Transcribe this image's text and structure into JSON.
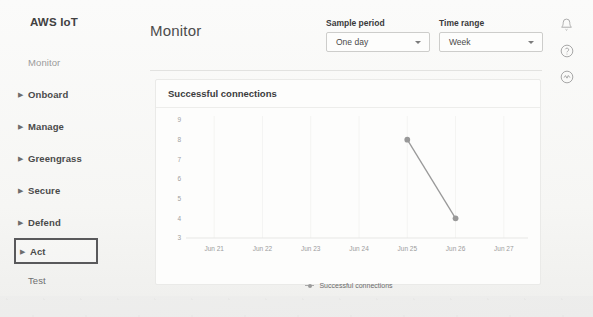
{
  "sidebar": {
    "brand": "AWS IoT",
    "items": [
      {
        "label": "Monitor",
        "style": "muted",
        "caret": false
      },
      {
        "label": "Onboard",
        "style": "bold",
        "caret": true
      },
      {
        "label": "Manage",
        "style": "bold",
        "caret": true
      },
      {
        "label": "Greengrass",
        "style": "bold",
        "caret": true
      },
      {
        "label": "Secure",
        "style": "bold",
        "caret": true
      },
      {
        "label": "Defend",
        "style": "bold",
        "caret": true
      },
      {
        "label": "Act",
        "style": "highlighted",
        "caret": true
      },
      {
        "label": "Test",
        "style": "plain",
        "caret": false
      }
    ],
    "caret_glyph": "▶"
  },
  "header": {
    "title": "Monitor",
    "controls": [
      {
        "label": "Sample period",
        "value": "One day",
        "name": "sample-period"
      },
      {
        "label": "Time range",
        "value": "Week",
        "name": "time-range"
      }
    ]
  },
  "toprail": {
    "icons": [
      {
        "name": "bell-icon",
        "title": "Notifications"
      },
      {
        "name": "help-icon",
        "title": "Help"
      },
      {
        "name": "settings-icon",
        "title": "Settings"
      }
    ]
  },
  "card": {
    "title": "Successful connections"
  },
  "chart_data": {
    "type": "line",
    "title": "Successful connections",
    "xlabel": "",
    "ylabel": "",
    "grid": true,
    "legend_position": "bottom",
    "x_tick_labels": [
      "Jun 21",
      "Jun 22",
      "Jun 23",
      "Jun 24",
      "Jun 25",
      "Jun 26",
      "Jun 27"
    ],
    "y_tick_labels": [
      "9",
      "8",
      "7",
      "6",
      "5",
      "4",
      "3"
    ],
    "ylim": [
      3,
      9
    ],
    "series": [
      {
        "name": "Successful connections",
        "color": "#999999",
        "points": [
          {
            "x": "Jun 25",
            "y": 8
          },
          {
            "x": "Jun 26",
            "y": 4
          }
        ]
      }
    ],
    "legend": [
      "Successful connections"
    ]
  }
}
